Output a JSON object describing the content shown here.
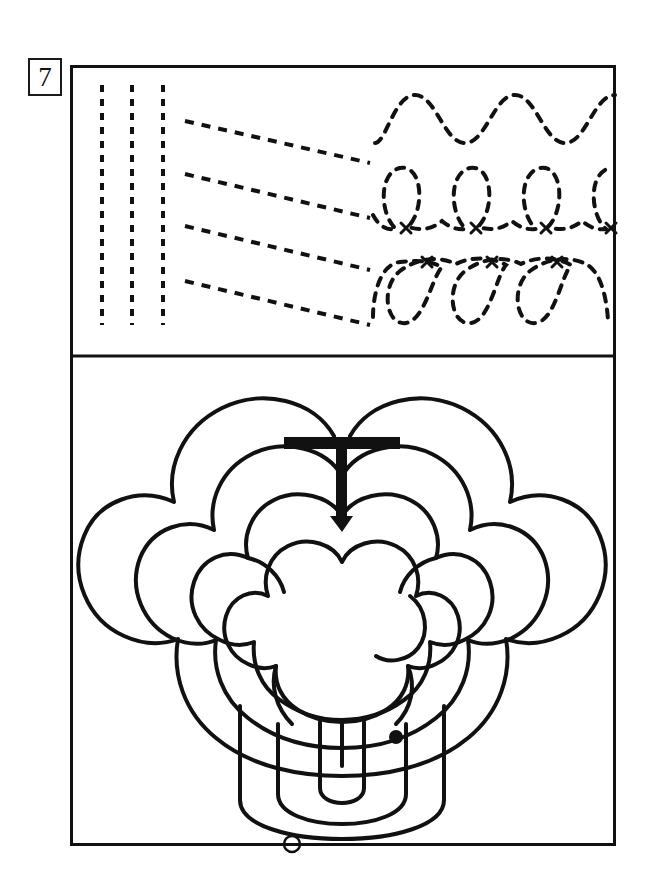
{
  "page": {
    "number": "7",
    "width": 648,
    "height": 889,
    "background_color": "#ffffff",
    "ink_color": "#111111"
  },
  "frame": {
    "name": "exercise-frame",
    "x": 70,
    "y": 65,
    "width": 546,
    "height": 781,
    "border_color": "#111111",
    "border_width": 3,
    "divider_y": 291
  },
  "tracing_panel": {
    "name": "pre-writing-tracing-exercises",
    "dash_color": "#111111",
    "dash_width": 4,
    "groups": [
      {
        "name": "vertical-lines-group",
        "pattern": "vertical-dashed-lines",
        "count": 3,
        "x_positions": [
          32,
          62,
          93
        ],
        "y_start": 20,
        "y_end": 260
      },
      {
        "name": "diagonal-lines-group",
        "pattern": "diagonal-dashed-lines",
        "count": 4,
        "x_start": 115,
        "x_end": 300,
        "y_starts": [
          56,
          109,
          161,
          216
        ],
        "y_ends": [
          98,
          153,
          205,
          260
        ]
      },
      {
        "name": "wave-row-group",
        "pattern": "sine-wave-dashed",
        "count": 1,
        "x_start": 305,
        "x_end": 540,
        "baseline_y": 55,
        "amplitude": 28,
        "cycles": 2.6
      },
      {
        "name": "upward-loops-row-group",
        "pattern": "dashed-loops-above-baseline",
        "loop_count": 4,
        "x_start": 305,
        "x_end": 540,
        "baseline_y": 160,
        "loop_height": 62,
        "start_marks": "x",
        "start_mark_count": 4
      },
      {
        "name": "downward-loops-row-group",
        "pattern": "dashed-loops-below-baseline",
        "loop_count": 3,
        "x_start": 305,
        "x_end": 540,
        "baseline_y": 207,
        "loop_height": 62,
        "start_marks": "x",
        "start_mark_count": 3
      }
    ]
  },
  "maze_panel": {
    "name": "trefoil-clover-maze",
    "shape": "trefoil",
    "ring_count": 4,
    "line_color": "#111111",
    "line_width": 4,
    "entrance_arrow": {
      "name": "entrance-arrow",
      "direction": "down",
      "bar_x_start": 214,
      "bar_x_end": 330,
      "bar_y": 87,
      "bar_thickness": 12,
      "stem_x": 272,
      "stem_y_end": 172,
      "stem_thickness": 11,
      "color": "#111111"
    },
    "markers": [
      {
        "name": "filled-dot-marker",
        "style": "filled",
        "cx": 326,
        "cy": 381,
        "r": 7,
        "color": "#111111"
      },
      {
        "name": "open-circle-marker",
        "style": "outline",
        "cx": 222,
        "cy": 488,
        "r": 8,
        "color": "#111111"
      }
    ]
  }
}
